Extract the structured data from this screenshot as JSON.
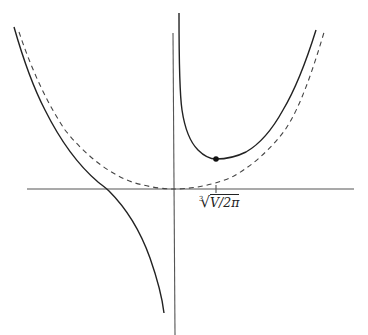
{
  "figure": {
    "tick_label": {
      "index": "3",
      "radical": "√",
      "radicand": "V/2π",
      "full": "∛(V/2π)"
    },
    "colors": {
      "curve": "#222222",
      "axis": "#555555",
      "dashed": "#444444",
      "background": "#ffffff"
    },
    "minimum_point": {
      "x": 216,
      "y": 159
    }
  }
}
